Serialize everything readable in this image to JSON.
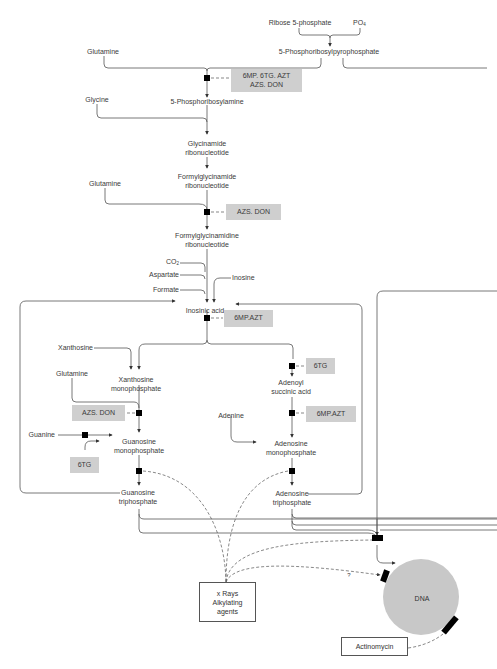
{
  "diagram": {
    "nodes": {
      "ribose5p": "Ribose 5-phosphate",
      "po4": "PO",
      "po4_sub": "4",
      "prpp": "5-Phosphoribosylpyrophosphate",
      "glutamine1": "Glutamine",
      "pra": "5-Phosphoribosylamine",
      "glycine": "Glycine",
      "gar_1": "Glycinamide",
      "gar_2": "ribonucleotide",
      "fgar_1": "Formylglycinamide",
      "fgar_2": "ribonucleotide",
      "glutamine2": "Glutamine",
      "fgam_1": "Formylglycinamidine",
      "fgam_2": "ribonucleotide",
      "co2": "CO",
      "co2_sub": "2",
      "aspartate": "Aspartate",
      "formate": "Formate",
      "inosine": "Inosine",
      "imp": "Inosinic acid",
      "xanthosine": "Xanthosine",
      "xmp_1": "Xanthosine",
      "xmp_2": "monophosphate",
      "glutamine3": "Glutamine",
      "guanine": "Guanine",
      "gmp_1": "Guanosine",
      "gmp_2": "monophosphate",
      "gtp_1": "Guanosine",
      "gtp_2": "triphosphate",
      "adenylosucc_1": "Adenoyl",
      "adenylosucc_2": "succinic acid",
      "adenine": "Adenine",
      "amp_1": "Adenosine",
      "amp_2": "monophosphate",
      "atp_1": "Adenosine",
      "atp_2": "triphosphate",
      "dna": "DNA",
      "question": "?"
    },
    "inhibitors": {
      "prpp_step_1": "6MP. 6TG. AZT",
      "prpp_step_2": "AZS. DON",
      "fgam_step": "AZS. DON",
      "imp_step": "6MP.AZT",
      "adenylosucc_step": "6TG",
      "amp_step": "6MP.AZT",
      "gmp_step": "AZS. DON",
      "guanine_step": "6TG"
    },
    "agents": {
      "xray_1": "x Rays",
      "xray_2": "Alkylating",
      "xray_3": "agents",
      "actinomycin": "Actinomycin"
    },
    "colors": {
      "line": "#444444",
      "inhibitor_fill": "#cfcfcf",
      "block": "#000000",
      "dna_fill": "#c8c8c8"
    }
  }
}
